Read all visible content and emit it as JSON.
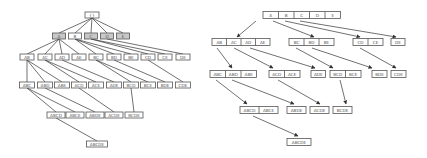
{
  "left_tree": {
    "title": "",
    "root": {
      "label": "{}",
      "x": 92,
      "y": 15,
      "w": 14
    },
    "levels": [
      [
        {
          "label": "A",
          "x": 59,
          "y": 36,
          "w": 13,
          "shaded": true
        },
        {
          "label": "B",
          "x": 75,
          "y": 36,
          "w": 13,
          "shaded": false
        },
        {
          "label": "C",
          "x": 91,
          "y": 36,
          "w": 13,
          "shaded": true
        },
        {
          "label": "D",
          "x": 107,
          "y": 36,
          "w": 13,
          "shaded": true
        },
        {
          "label": "E",
          "x": 123,
          "y": 36,
          "w": 13,
          "shaded": true
        }
      ],
      [
        {
          "label": "AB",
          "x": 27,
          "y": 57,
          "w": 14
        },
        {
          "label": "AC",
          "x": 45,
          "y": 57,
          "w": 14
        },
        {
          "label": "AD",
          "x": 62,
          "y": 57,
          "w": 14
        },
        {
          "label": "AE",
          "x": 79,
          "y": 57,
          "w": 14
        },
        {
          "label": "BC",
          "x": 96,
          "y": 57,
          "w": 14
        },
        {
          "label": "BD",
          "x": 114,
          "y": 57,
          "w": 14
        },
        {
          "label": "BE",
          "x": 131,
          "y": 57,
          "w": 14
        },
        {
          "label": "CD",
          "x": 148,
          "y": 57,
          "w": 14
        },
        {
          "label": "CE",
          "x": 165,
          "y": 57,
          "w": 14
        },
        {
          "label": "DE",
          "x": 183,
          "y": 57,
          "w": 14
        }
      ],
      [
        {
          "label": "ABC",
          "x": 27,
          "y": 85,
          "w": 15
        },
        {
          "label": "ABD",
          "x": 45,
          "y": 85,
          "w": 15
        },
        {
          "label": "ABE",
          "x": 62,
          "y": 85,
          "w": 15
        },
        {
          "label": "ACD",
          "x": 79,
          "y": 85,
          "w": 15
        },
        {
          "label": "ACE",
          "x": 96,
          "y": 85,
          "w": 15
        },
        {
          "label": "ADE",
          "x": 114,
          "y": 85,
          "w": 15
        },
        {
          "label": "BCD",
          "x": 131,
          "y": 85,
          "w": 15
        },
        {
          "label": "BCE",
          "x": 148,
          "y": 85,
          "w": 15
        },
        {
          "label": "BDE",
          "x": 165,
          "y": 85,
          "w": 15
        },
        {
          "label": "CDE",
          "x": 183,
          "y": 85,
          "w": 15
        }
      ],
      [
        {
          "label": "ABCD",
          "x": 56,
          "y": 115,
          "w": 18
        },
        {
          "label": "ABCE",
          "x": 75,
          "y": 115,
          "w": 18
        },
        {
          "label": "ABDE",
          "x": 95,
          "y": 115,
          "w": 18
        },
        {
          "label": "ACDE",
          "x": 114,
          "y": 115,
          "w": 18
        },
        {
          "label": "BCDE",
          "x": 134,
          "y": 115,
          "w": 18
        }
      ],
      [
        {
          "label": "ABCDE",
          "x": 97,
          "y": 144,
          "w": 21
        }
      ]
    ],
    "edges": [
      [
        "{}",
        "A"
      ],
      [
        "{}",
        "B"
      ],
      [
        "{}",
        "C"
      ],
      [
        "{}",
        "D"
      ],
      [
        "{}",
        "E"
      ],
      [
        "A",
        "AB"
      ],
      [
        "A",
        "AC"
      ],
      [
        "A",
        "AD"
      ],
      [
        "A",
        "AE"
      ],
      [
        "B",
        "BC"
      ],
      [
        "B",
        "BD"
      ],
      [
        "B",
        "BE"
      ],
      [
        "C",
        "CD"
      ],
      [
        "C",
        "CE"
      ],
      [
        "D",
        "DE"
      ],
      [
        "AB",
        "ABC"
      ],
      [
        "AB",
        "ABD"
      ],
      [
        "AB",
        "ABE"
      ],
      [
        "AC",
        "ACD"
      ],
      [
        "AC",
        "ACE"
      ],
      [
        "AD",
        "ADE"
      ],
      [
        "BC",
        "BCD"
      ],
      [
        "BC",
        "BCE"
      ],
      [
        "BD",
        "BDE"
      ],
      [
        "CD",
        "CDE"
      ],
      [
        "ABC",
        "ABCD"
      ],
      [
        "ABC",
        "ABCE"
      ],
      [
        "ABD",
        "ABDE"
      ],
      [
        "ACD",
        "ACDE"
      ],
      [
        "BCD",
        "BCDE"
      ],
      [
        "ABCD",
        "ABCDE"
      ]
    ]
  },
  "right_tree": {
    "groups": [
      {
        "y": 15,
        "x": 263,
        "cellw": 15.5,
        "labels": [
          "A",
          "B",
          "C",
          "D",
          "E"
        ]
      },
      {
        "y": 42,
        "x": 212,
        "cellw": 14.5,
        "labels": [
          "AB",
          "AC",
          "AD",
          "AE"
        ]
      },
      {
        "y": 42,
        "x": 289,
        "cellw": 15,
        "labels": [
          "BC",
          "BD",
          "BE"
        ]
      },
      {
        "y": 42,
        "x": 353,
        "cellw": 15,
        "labels": [
          "CD",
          "CE"
        ]
      },
      {
        "y": 42,
        "x": 391,
        "cellw": 14,
        "labels": [
          "DE"
        ]
      },
      {
        "y": 74,
        "x": 210,
        "cellw": 15.5,
        "labels": [
          "ABC",
          "ABD",
          "ABE"
        ]
      },
      {
        "y": 74,
        "x": 269,
        "cellw": 15.5,
        "labels": [
          "ACD",
          "ACE"
        ]
      },
      {
        "y": 74,
        "x": 311,
        "cellw": 14.5,
        "labels": [
          "ADE"
        ]
      },
      {
        "y": 74,
        "x": 330,
        "cellw": 15.5,
        "labels": [
          "BCD",
          "BCE"
        ]
      },
      {
        "y": 74,
        "x": 372,
        "cellw": 15,
        "labels": [
          "BDE"
        ]
      },
      {
        "y": 74,
        "x": 391,
        "cellw": 15,
        "labels": [
          "CDE"
        ]
      },
      {
        "y": 110,
        "x": 240,
        "cellw": 19,
        "labels": [
          "ABCD",
          "ABCE"
        ]
      },
      {
        "y": 110,
        "x": 287,
        "cellw": 19,
        "labels": [
          "ABDE"
        ]
      },
      {
        "y": 110,
        "x": 310,
        "cellw": 19,
        "labels": [
          "ACDE"
        ]
      },
      {
        "y": 110,
        "x": 333,
        "cellw": 19,
        "labels": [
          "BCDE"
        ]
      },
      {
        "y": 142,
        "x": 287,
        "cellw": 24,
        "labels": [
          "ABCDE"
        ]
      }
    ],
    "arrows": [
      [
        [
          256,
          21
        ],
        [
          237,
          37
        ]
      ],
      [
        [
          273,
          21
        ],
        [
          314,
          37
        ]
      ],
      [
        [
          285,
          21
        ],
        [
          360,
          37
        ]
      ],
      [
        [
          300,
          21
        ],
        [
          396,
          37
        ]
      ],
      [
        [
          217,
          48
        ],
        [
          232,
          68
        ]
      ],
      [
        [
          234,
          48
        ],
        [
          273,
          68
        ]
      ],
      [
        [
          250,
          48
        ],
        [
          315,
          68
        ]
      ],
      [
        [
          296,
          48
        ],
        [
          333,
          68
        ]
      ],
      [
        [
          312,
          48
        ],
        [
          372,
          68
        ]
      ],
      [
        [
          360,
          48
        ],
        [
          396,
          68
        ]
      ],
      [
        [
          216,
          80
        ],
        [
          247,
          104
        ]
      ],
      [
        [
          232,
          80
        ],
        [
          294,
          104
        ]
      ],
      [
        [
          278,
          80
        ],
        [
          320,
          104
        ]
      ],
      [
        [
          340,
          80
        ],
        [
          346,
          104
        ]
      ],
      [
        [
          253,
          116
        ],
        [
          298,
          136
        ]
      ]
    ]
  }
}
